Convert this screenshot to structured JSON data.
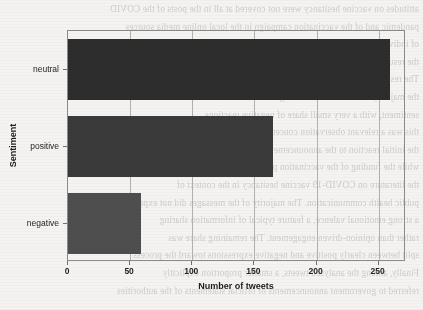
{
  "chart_data": {
    "type": "bar",
    "orientation": "horizontal",
    "title": "",
    "xlabel": "Number of tweets",
    "ylabel": "Sentiment",
    "categories": [
      "negative",
      "positive",
      "neutral"
    ],
    "values": [
      59,
      165,
      259
    ],
    "series": [
      {
        "name": "Number of tweets",
        "values": [
          59,
          165,
          259
        ]
      }
    ],
    "bars": [
      {
        "category": "negative",
        "value": 59,
        "color": "#4e4e4e"
      },
      {
        "category": "positive",
        "value": 165,
        "color": "#3a3a3a"
      },
      {
        "category": "neutral",
        "value": 259,
        "color": "#2d2d2d"
      }
    ],
    "xlim": [
      0,
      272
    ],
    "xticks": [
      0,
      50,
      100,
      150,
      200,
      250
    ],
    "xtick_labels": [
      "0",
      "50",
      "100",
      "150",
      "200",
      "250"
    ],
    "ytick_labels": [
      "neutral",
      "positive",
      "negative"
    ],
    "grid": "vertical",
    "gridlines_at": [
      50,
      100,
      150,
      200,
      250
    ],
    "legend": "none",
    "legend_position": "none",
    "frame": "box",
    "background_color": "#f4f3f1",
    "axis_color": "#8b8b8b",
    "grid_color": "#b3b1ae",
    "text_color": "#1d1d1d"
  },
  "page_bleed": {
    "note": "faint mirrored show-through text from the reverse side of the scanned page",
    "lines": [
      "attitudes on vaccine hesitancy were not covered at all in the posts of the COVID",
      "pandemic and of the vaccination campaign in the local online media sources",
      "of individual and collective behaviours during the pandemic period",
      "the results contributing to the public discourse analysis on the topics",
      "The results of our sentiment analysis on the tweets showed that",
      "the majority of the collected messages were classified as neutral",
      "sentiment, with a very small share of negative reactions",
      "this was a relevant observation concerning the general audience",
      "the initial reaction to the announcement was mostly neutral",
      "while the funding of the vaccination process would begin",
      "the literature on COVID-19 vaccine hesitancy in the context of",
      "public health communication. The majority of the messages did not express",
      "a strong emotional valence, a feature typical of information sharing",
      "rather than opinion-driven engagement. The remaining share was",
      "split between clearly positive and negative expressions toward the process",
      "Finally, among the analysed tweets, a smaller proportion explicitly",
      "referred to government announcements or official statements of the authorities"
    ]
  }
}
